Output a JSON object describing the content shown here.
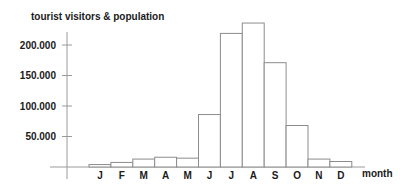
{
  "chart_data": {
    "type": "bar",
    "title": "tourist visitors & population",
    "xlabel": "month",
    "ylabel": "",
    "categories": [
      "J",
      "F",
      "M",
      "A",
      "M",
      "J",
      "J",
      "A",
      "S",
      "O",
      "N",
      "D"
    ],
    "values": [
      4000,
      7500,
      13000,
      16000,
      14500,
      86000,
      219000,
      236000,
      171000,
      68000,
      13000,
      9000
    ],
    "ylim": [
      0,
      250000
    ],
    "yticks": [
      50000,
      100000,
      150000,
      200000
    ],
    "ytick_labels": [
      "50.000",
      "100.000",
      "150.000",
      "200.000"
    ],
    "grid": false,
    "legend": "none"
  }
}
